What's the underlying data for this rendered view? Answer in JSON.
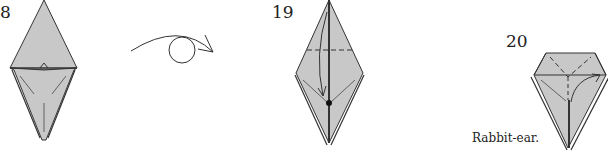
{
  "diagram": {
    "type": "origami-instructions",
    "colors": {
      "paper": "#c8c8c8",
      "line": "#333333",
      "background": "#ffffff"
    },
    "steps": [
      {
        "number": "8",
        "description": "Kite base with bottom flaps folded up; mountain-fold hints"
      },
      {
        "symbol": "turn-over",
        "description": "Turn the model over (circle with curved arrow)"
      },
      {
        "number": "19",
        "description": "Valley fold top flap down along dashed line; pivot dot"
      },
      {
        "number": "20",
        "caption": "Rabbit-ear.",
        "description": "Rabbit-ear fold with dashed Y creases and arrow"
      }
    ]
  }
}
